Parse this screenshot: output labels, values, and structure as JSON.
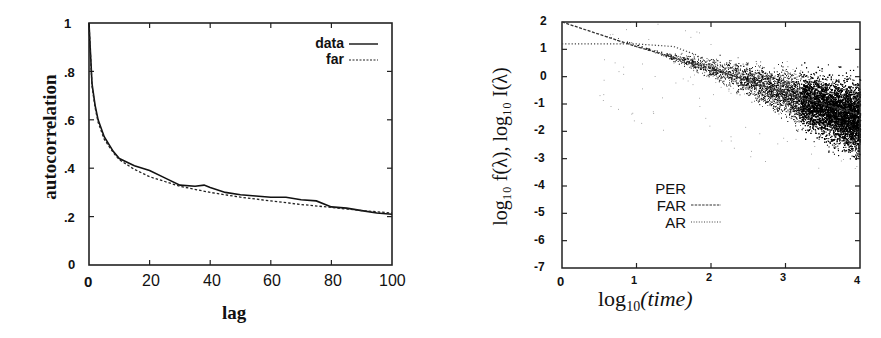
{
  "chart_data": [
    {
      "type": "line",
      "title": "",
      "xlabel": "lag",
      "ylabel": "autocorrelation",
      "xlim": [
        0,
        100
      ],
      "ylim": [
        0,
        1
      ],
      "x_ticks": [
        "0",
        "20",
        "40",
        "60",
        "80",
        "100"
      ],
      "y_ticks": [
        "0",
        ".2",
        ".4",
        ".6",
        ".8",
        "1"
      ],
      "grid": false,
      "legend_position": "upper right",
      "series": [
        {
          "name": "data",
          "style": "solid",
          "x": [
            0,
            1,
            2,
            3,
            5,
            8,
            10,
            15,
            20,
            25,
            30,
            35,
            38,
            40,
            45,
            50,
            55,
            60,
            65,
            70,
            75,
            80,
            85,
            90,
            95,
            100
          ],
          "values": [
            1.0,
            0.75,
            0.66,
            0.6,
            0.53,
            0.47,
            0.44,
            0.41,
            0.39,
            0.36,
            0.33,
            0.325,
            0.33,
            0.32,
            0.3,
            0.29,
            0.285,
            0.28,
            0.28,
            0.27,
            0.265,
            0.24,
            0.235,
            0.225,
            0.215,
            0.21
          ]
        },
        {
          "name": "far",
          "style": "dotted",
          "x": [
            0,
            1,
            2,
            3,
            5,
            8,
            10,
            15,
            20,
            25,
            30,
            40,
            50,
            60,
            70,
            80,
            90,
            100
          ],
          "values": [
            1.0,
            0.74,
            0.65,
            0.59,
            0.52,
            0.465,
            0.435,
            0.395,
            0.365,
            0.345,
            0.325,
            0.3,
            0.28,
            0.265,
            0.25,
            0.238,
            0.225,
            0.215
          ]
        }
      ],
      "legend": [
        "data",
        "far"
      ]
    },
    {
      "type": "scatter",
      "title": "",
      "xlabel": "log10(time)",
      "ylabel": "log10 f(λ), log10 I(λ)",
      "xlim": [
        0,
        4
      ],
      "ylim": [
        -7,
        2
      ],
      "x_ticks": [
        "0",
        "1",
        "2",
        "3",
        "4"
      ],
      "y_ticks": [
        "-7",
        "-6",
        "-5",
        "-4",
        "-3",
        "-2",
        "-1",
        "0",
        "1",
        "2"
      ],
      "grid": false,
      "legend_position": "lower left",
      "series": [
        {
          "name": "PER",
          "style": "points",
          "description": "dense periodogram scatter fanning out from x≈1.5 to 4, centered on FAR line, spread widening to roughly -3 to -0.5 at x=4"
        },
        {
          "name": "FAR",
          "style": "dashed",
          "x": [
            0,
            1,
            2,
            3,
            4
          ],
          "values": [
            2.0,
            1.1,
            0.3,
            -0.6,
            -1.4
          ]
        },
        {
          "name": "AR",
          "style": "dotted",
          "x": [
            0,
            0.5,
            1,
            1.5,
            1.8,
            2,
            2.5,
            3,
            4
          ],
          "values": [
            1.2,
            1.2,
            1.2,
            1.1,
            0.8,
            0.4,
            -0.2,
            -0.6,
            -1.4
          ]
        }
      ],
      "legend": [
        "PER",
        "FAR",
        "AR"
      ]
    }
  ],
  "left": {
    "ylabel": "autocorrelation",
    "xlabel": "lag",
    "yticks": [
      ".8",
      ".6",
      ".4",
      ".2"
    ],
    "ytick_top": "1",
    "ytick_zero": "0",
    "xticks": [
      "0",
      "20",
      "40",
      "60",
      "80",
      "100"
    ],
    "legend": {
      "data": "data",
      "far": "far"
    }
  },
  "right": {
    "ylabel": "log₁₀ f(λ),  log₁₀ I(λ)",
    "xlabel_main": "log",
    "xlabel_sub": "10",
    "xlabel_rest": "(time)",
    "yticks": [
      "2",
      "1",
      "0",
      "-1",
      "-2",
      "-3",
      "-4",
      "-5",
      "-6",
      "-7"
    ],
    "xticks": [
      "0",
      "1",
      "2",
      "3",
      "4"
    ],
    "legend": {
      "per": "PER",
      "far": "FAR",
      "ar": "AR"
    }
  }
}
